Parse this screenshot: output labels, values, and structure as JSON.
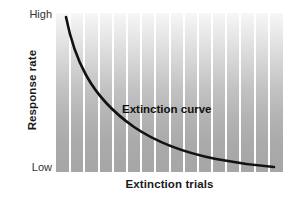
{
  "chart_data": {
    "type": "line",
    "title": "",
    "xlabel": "Extinction trials",
    "ylabel": "Response rate",
    "x_tick_labels": [],
    "y_tick_labels": [
      "High",
      "Low"
    ],
    "ylim_labels": {
      "top": "High",
      "bottom": "Low"
    },
    "grid": "vertical-bands",
    "band_count": 16,
    "legend": "none",
    "annotations": [
      {
        "text": "Extinction curve",
        "x": 0.46,
        "y": 0.5
      }
    ],
    "series": [
      {
        "name": "Extinction curve",
        "style": "smooth-decay",
        "x": [
          0.04,
          0.07,
          0.1,
          0.14,
          0.19,
          0.25,
          0.32,
          0.4,
          0.49,
          0.58,
          0.68,
          0.78,
          0.88,
          0.95
        ],
        "y": [
          1.0,
          0.86,
          0.74,
          0.63,
          0.53,
          0.45,
          0.38,
          0.32,
          0.26,
          0.21,
          0.17,
          0.13,
          0.1,
          0.09
        ]
      }
    ]
  },
  "axes": {
    "y_title": "Response rate",
    "x_title": "Extinction trials",
    "y_high_label": "High",
    "y_low_label": "Low"
  },
  "plot": {
    "annotation_label": "Extinction curve"
  },
  "colors": {
    "curve": "#121212",
    "band_light": "#f3f3f3",
    "band_dark": "#a6a6a6",
    "stripe_gap": "#ffffff",
    "text": "#1a1a1a",
    "background": "#ffffff"
  }
}
